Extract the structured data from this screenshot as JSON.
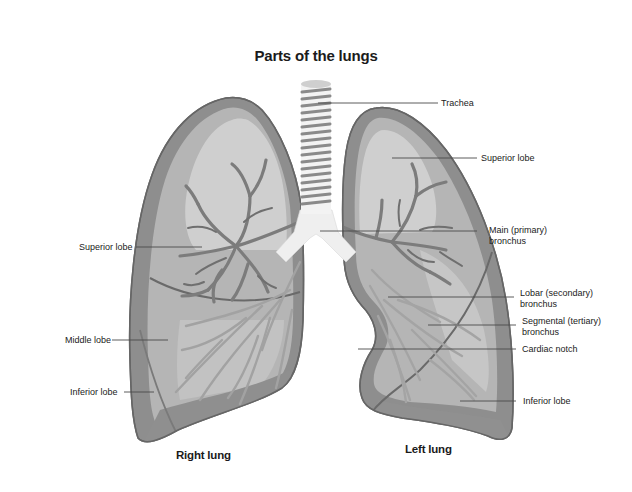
{
  "title": "Parts of the lungs",
  "captions": {
    "right_lung": "Right lung",
    "left_lung": "Left lung"
  },
  "labels": {
    "trachea": "Trachea",
    "left_superior_lobe": "Superior lobe",
    "right_superior_lobe": "Superior lobe",
    "main_bronchus": "Main (primary)\n bronchus",
    "lobar_bronchus": "Lobar (secondary)\nbronchus",
    "segmental_bronchus": "Segmental (tertiary)\nbronchus",
    "cardiac_notch": "Cardiac notch",
    "middle_lobe": "Middle lobe",
    "right_inferior_lobe": "Inferior lobe",
    "left_inferior_lobe": "Inferior lobe"
  },
  "colors": {
    "background": "#ffffff",
    "lung_outline": "#6e6e6e",
    "lung_border_band": "#8e8e8e",
    "lung_fill": "#b3b3b3",
    "lung_inner_light": "#d2d2d2",
    "airway_dark": "#7a7a7a",
    "airway_light": "#a8a8a8",
    "trachea_fill": "#f2f2f2",
    "trachea_ring": "#8a8a8a",
    "leader_line": "#4a4a4a"
  }
}
